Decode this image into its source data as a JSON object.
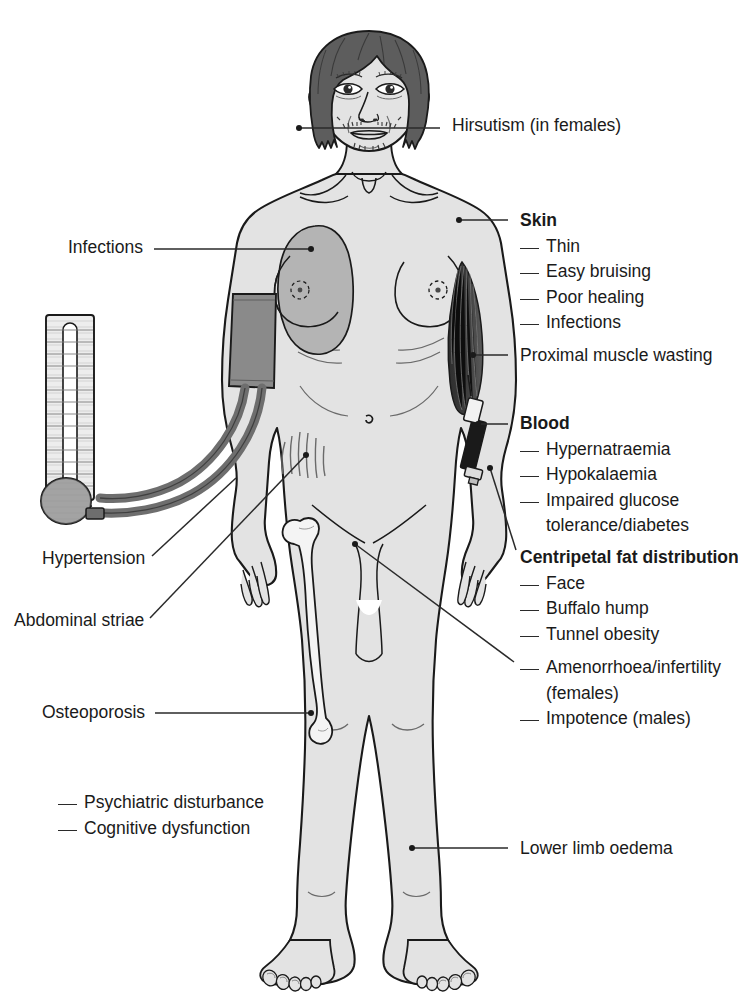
{
  "diagram": {
    "colors": {
      "line": "#1a1a1a",
      "skin_fill": "#e3e3e3",
      "hair_fill": "#5d5d5d",
      "infection_patch": "#b4b4b4",
      "cuff_fill": "#8a8a8a",
      "tubing": "#6e6e6e",
      "muscle_fill": "#3a3a3a",
      "bone_fill": "#f4f4f4",
      "gauge_fill": "#ededed",
      "leader_line": "#2a2a2a"
    }
  },
  "labels_right": [
    {
      "id": "hirsutism",
      "text": "Hirsutism (in females)",
      "heading": null,
      "items": [],
      "x": 452,
      "y": 113,
      "leader": {
        "x1": 299,
        "y1": 128,
        "x2": 440,
        "y2": 128,
        "dot": [
          299,
          128
        ]
      }
    },
    {
      "id": "skin",
      "heading": "Skin",
      "text": null,
      "items": [
        "Thin",
        "Easy bruising",
        "Poor healing",
        "Infections"
      ],
      "x": 520,
      "y": 208,
      "leader": {
        "x1": 459,
        "y1": 220,
        "x2": 508,
        "y2": 220,
        "dot": [
          459,
          220
        ]
      }
    },
    {
      "id": "proximal-muscle-wasting",
      "text": "Proximal muscle wasting",
      "heading": null,
      "items": [],
      "x": 520,
      "y": 343,
      "leader": {
        "x1": 473,
        "y1": 355,
        "x2": 508,
        "y2": 355,
        "dot": [
          473,
          355
        ]
      }
    },
    {
      "id": "blood",
      "heading": "Blood",
      "text": null,
      "items": [
        "Hypernatraemia",
        "Hypokalaemia",
        "Impaired glucose",
        "tolerance/diabetes"
      ],
      "items_continuation": [
        false,
        false,
        false,
        true
      ],
      "x": 520,
      "y": 411,
      "leader": {
        "x1": 478,
        "y1": 424,
        "x2": 508,
        "y2": 424,
        "dot": [
          478,
          424
        ]
      }
    },
    {
      "id": "centripetal-fat-distribution",
      "heading": "Centripetal fat distribution",
      "text": null,
      "items": [
        "Face",
        "Buffalo hump",
        "Tunnel obesity"
      ],
      "x": 520,
      "y": 545,
      "leader": {
        "x1": 490,
        "y1": 468,
        "x2": 516,
        "y2": 550,
        "dot": [
          490,
          468
        ]
      }
    },
    {
      "id": "amenorrhoea-impotence",
      "heading": null,
      "text": null,
      "items": [
        "Amenorrhoea/infertility",
        "(females)",
        "Impotence (males)"
      ],
      "items_continuation": [
        false,
        true,
        false
      ],
      "x": 520,
      "y": 655,
      "leader": {
        "x1": 355,
        "y1": 544,
        "x2": 514,
        "y2": 662,
        "dot": [
          355,
          544
        ]
      }
    },
    {
      "id": "lower-limb-oedema",
      "text": "Lower limb oedema",
      "heading": null,
      "items": [],
      "x": 520,
      "y": 836,
      "leader": {
        "x1": 412,
        "y1": 848,
        "x2": 508,
        "y2": 848,
        "dot": [
          412,
          848
        ]
      }
    }
  ],
  "labels_left": [
    {
      "id": "infections",
      "text": "Infections",
      "x": 68,
      "y": 235,
      "leader": {
        "x1": 154,
        "y1": 249,
        "x2": 311,
        "y2": 249,
        "dot": [
          311,
          249
        ]
      }
    },
    {
      "id": "hypertension",
      "text": "Hypertension",
      "x": 42,
      "y": 561,
      "leader": {
        "x1": 152,
        "y1": 560,
        "x2": 232,
        "y2": 480,
        "dot": null
      }
    },
    {
      "id": "abdominal-striae",
      "text": "Abdominal striae",
      "x": 14,
      "y": 612,
      "leader": {
        "x1": 150,
        "y1": 620,
        "x2": 306,
        "y2": 455,
        "dot": [
          306,
          455
        ]
      }
    },
    {
      "id": "osteoporosis",
      "text": "Osteoporosis",
      "x": 42,
      "y": 700,
      "leader": {
        "x1": 155,
        "y1": 713,
        "x2": 311,
        "y2": 713,
        "dot": [
          311,
          713
        ]
      }
    }
  ],
  "labels_free": [
    {
      "id": "neuropsychiatric",
      "x": 58,
      "y": 790,
      "items": [
        "Psychiatric disturbance",
        "Cognitive dysfunction"
      ]
    }
  ],
  "figure_parts": [
    {
      "name": "head",
      "feature": "moon-face"
    },
    {
      "name": "hair",
      "feature": "dark-bob"
    },
    {
      "name": "facial-hair",
      "feature": "hirsutism-moustache-chin"
    },
    {
      "name": "chest-infection-patch",
      "feature": "shaded-skin-lesion"
    },
    {
      "name": "blood-pressure-cuff",
      "feature": "arm-cuff"
    },
    {
      "name": "mercury-sphygmomanometer",
      "feature": "column-gauge-with-scale"
    },
    {
      "name": "inflation-bulb",
      "feature": "rubber-bulb"
    },
    {
      "name": "wasted-upper-arm-muscle",
      "feature": "striated-dark-muscle"
    },
    {
      "name": "syringe",
      "feature": "blood-sample-syringe"
    },
    {
      "name": "abdominal-striae",
      "feature": "stretch-mark-lines"
    },
    {
      "name": "femur",
      "feature": "osteoporotic-long-bone"
    },
    {
      "name": "lower-limbs",
      "feature": "oedematous-legs-and-feet"
    }
  ]
}
